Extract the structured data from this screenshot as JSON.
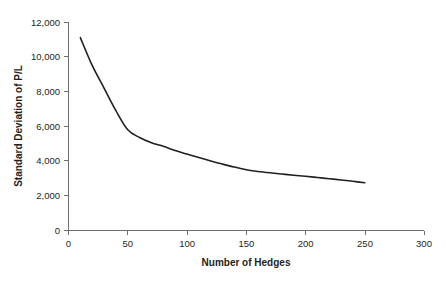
{
  "chart_data": {
    "type": "line",
    "title": "",
    "xlabel": "Number of Hedges",
    "ylabel": "Standard Deviation of P/L",
    "xlim": [
      0,
      300
    ],
    "ylim": [
      0,
      12000
    ],
    "grid": false,
    "legend": "none",
    "x_ticks": [
      "0",
      "50",
      "100",
      "150",
      "200",
      "250",
      "300"
    ],
    "x_tick_values": [
      0,
      50,
      100,
      150,
      200,
      250,
      300
    ],
    "y_ticks": [
      "0",
      "2,000",
      "4,000",
      "6,000",
      "8,000",
      "10,000",
      "12,000"
    ],
    "y_tick_values": [
      0,
      2000,
      4000,
      6000,
      8000,
      10000,
      12000
    ],
    "series": [
      {
        "name": "Standard Deviation of P/L",
        "color": "#231f20",
        "x": [
          10,
          20,
          30,
          40,
          50,
          60,
          70,
          80,
          90,
          100,
          110,
          120,
          130,
          140,
          150,
          160,
          170,
          180,
          190,
          200,
          210,
          220,
          230,
          240,
          250
        ],
        "values": [
          11100,
          9500,
          8200,
          6900,
          5800,
          5350,
          5050,
          4850,
          4600,
          4400,
          4200,
          4000,
          3820,
          3650,
          3500,
          3400,
          3320,
          3250,
          3180,
          3120,
          3050,
          2980,
          2910,
          2830,
          2750
        ]
      }
    ]
  },
  "axes": {
    "y_axis_title": "Standard Deviation of P/L",
    "x_axis_title": "Number of Hedges"
  },
  "colors": {
    "series": "#231f20",
    "axis": "#6d6e71",
    "text": "#231f20",
    "background": "#ffffff"
  }
}
